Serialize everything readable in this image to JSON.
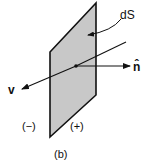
{
  "figure": {
    "caption": "(b)",
    "surface_label": "dS",
    "velocity_label": "v",
    "normal_label": "n̂",
    "negative_side_label": "(−)",
    "positive_side_label": "(+)"
  },
  "colors": {
    "surface_fill": "#c8c8c8",
    "stroke": "#111111",
    "background": "#ffffff"
  }
}
